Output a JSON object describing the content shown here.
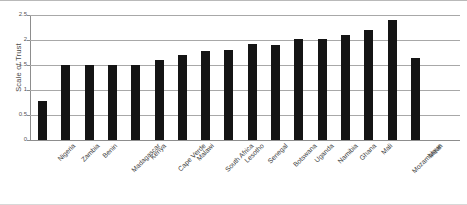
{
  "chart_data": {
    "type": "bar",
    "title": "",
    "xlabel": "",
    "ylabel": "Scale of Trust",
    "ylim": [
      0,
      2.5
    ],
    "yticks": [
      0,
      0.5,
      1,
      1.5,
      2,
      2.5
    ],
    "ytick_labels": [
      "0",
      "0.5",
      "1",
      "1.5",
      "2",
      "2.5"
    ],
    "grid": true,
    "legend": "none",
    "bar_color": "#141414",
    "categories": [
      "Nigeria",
      "Zambia",
      "Benin",
      "Madagascar",
      "Kenya",
      "Cape Verde",
      "Malawi",
      "South Africa",
      "Lesotho",
      "Senegal",
      "Botswana",
      "Uganda",
      "Namibia",
      "Ghana",
      "Mali",
      "Mozambique",
      "Mean"
    ],
    "values": [
      0.78,
      1.5,
      1.5,
      1.5,
      1.5,
      1.6,
      1.7,
      1.78,
      1.8,
      1.92,
      1.9,
      2.02,
      2.02,
      2.1,
      2.2,
      2.4,
      1.65
    ]
  }
}
